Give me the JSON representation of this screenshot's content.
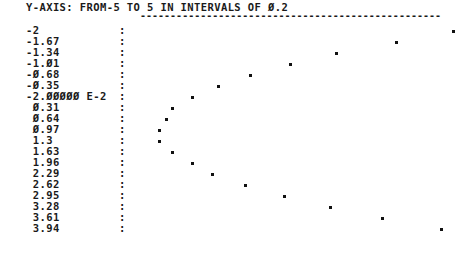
{
  "header": {
    "title": "Y-AXIS: FROM-5 TO 5 IN INTERVALS OF Ø.2",
    "dashes": "--------------------------------------------------"
  },
  "rows": [
    {
      "label": "-2",
      "dot_x": 453,
      "y": 31
    },
    {
      "label": "-1.67",
      "dot_x": 396,
      "y": 42
    },
    {
      "label": "-1.34",
      "dot_x": 336,
      "y": 53
    },
    {
      "label": "-1.Ø1",
      "dot_x": 290,
      "y": 64
    },
    {
      "label": "-Ø.68",
      "dot_x": 250,
      "y": 75
    },
    {
      "label": "-Ø.35",
      "dot_x": 218,
      "y": 86
    },
    {
      "label": "-2.ØØØØØ E-2",
      "dot_x": 192,
      "y": 97
    },
    {
      "label": " Ø.31",
      "dot_x": 172,
      "y": 108
    },
    {
      "label": " Ø.64",
      "dot_x": 166,
      "y": 119
    },
    {
      "label": " Ø.97",
      "dot_x": 159,
      "y": 130
    },
    {
      "label": " 1.3",
      "dot_x": 159,
      "y": 141
    },
    {
      "label": " 1.63",
      "dot_x": 172,
      "y": 152
    },
    {
      "label": " 1.96",
      "dot_x": 192,
      "y": 163
    },
    {
      "label": " 2.29",
      "dot_x": 212,
      "y": 174
    },
    {
      "label": " 2.62",
      "dot_x": 245,
      "y": 185
    },
    {
      "label": " 2.95",
      "dot_x": 284,
      "y": 196
    },
    {
      "label": " 3.28",
      "dot_x": 330,
      "y": 207
    },
    {
      "label": " 3.61",
      "dot_x": 382,
      "y": 218
    },
    {
      "label": " 3.94",
      "dot_x": 441,
      "y": 229
    }
  ],
  "colon": ":",
  "chart_data": {
    "type": "scatter",
    "orientation": "x values listed vertically as row labels; y plotted horizontally",
    "xlabel": "",
    "ylabel": "Y",
    "ylim": [
      -5,
      5
    ],
    "y_interval": 0.2,
    "grid": false,
    "x": [
      -2,
      -1.67,
      -1.34,
      -1.01,
      -0.68,
      -0.35,
      -0.02,
      0.31,
      0.64,
      0.97,
      1.3,
      1.63,
      1.96,
      2.29,
      2.62,
      2.95,
      3.28,
      3.61,
      3.94
    ],
    "values": [
      5.0,
      3.4,
      1.4,
      -0.1,
      -1.4,
      -2.5,
      -3.3,
      -4.0,
      -4.2,
      -4.4,
      -4.4,
      -4.0,
      -3.3,
      -2.7,
      -1.6,
      -0.3,
      1.2,
      3.0,
      4.9
    ]
  }
}
